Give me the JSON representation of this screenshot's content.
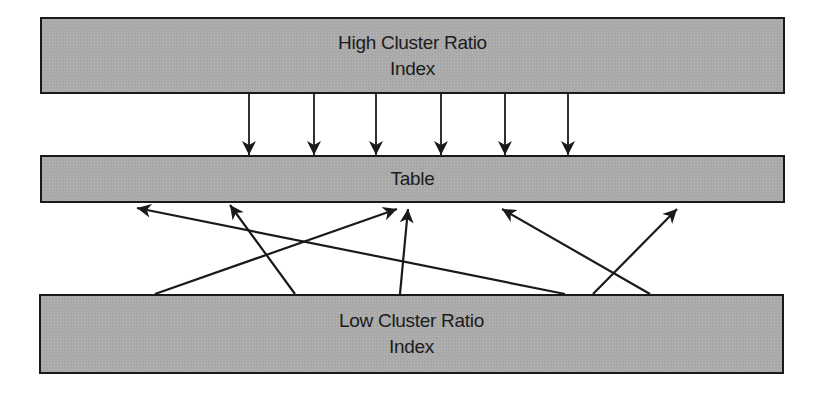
{
  "diagram": {
    "high_index": {
      "line1": "High Cluster Ratio",
      "line2": "Index"
    },
    "table": {
      "label": "Table"
    },
    "low_index": {
      "line1": "Low Cluster Ratio",
      "line2": "Index"
    },
    "colors": {
      "box_fill": "#a9a9a9",
      "border": "#1a1a1a",
      "arrow": "#1a1a1a",
      "background": "#ffffff"
    },
    "down_arrows_x": [
      249,
      314,
      376,
      441,
      505,
      568
    ],
    "up_arrows": [
      {
        "from": [
          565,
          294
        ],
        "to": [
          137,
          208
        ]
      },
      {
        "from": [
          295,
          294
        ],
        "to": [
          230,
          205
        ]
      },
      {
        "from": [
          155,
          294
        ],
        "to": [
          397,
          209
        ]
      },
      {
        "from": [
          400,
          294
        ],
        "to": [
          408,
          209
        ]
      },
      {
        "from": [
          650,
          294
        ],
        "to": [
          502,
          209
        ]
      },
      {
        "from": [
          593,
          294
        ],
        "to": [
          677,
          209
        ]
      }
    ]
  }
}
